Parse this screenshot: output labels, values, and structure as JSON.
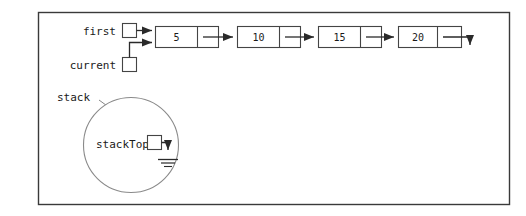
{
  "diagram": {
    "title_text": "",
    "background_color": "#ffffff",
    "outline_color": "#3a3a3a",
    "stroke_color": "#333333",
    "fill_color": "#ffffff",
    "frame": {
      "x": 38,
      "y": 12,
      "width": 472,
      "height": 193
    },
    "pointers": [
      {
        "name": "first",
        "label": "first",
        "box_x": 122,
        "box_y": 23,
        "box_size": 15,
        "label_x": 116,
        "label_y": 35
      },
      {
        "name": "current",
        "label": "current",
        "box_x": 122,
        "box_y": 57,
        "box_size": 15,
        "label_x": 116,
        "label_y": 69
      }
    ],
    "linked_list": {
      "node_width": 64,
      "node_height": 22,
      "data_cell_width": 42,
      "node_y": 26,
      "nodes": [
        {
          "value": "5",
          "x": 155
        },
        {
          "value": "10",
          "x": 237
        },
        {
          "value": "15",
          "x": 318
        },
        {
          "value": "20",
          "x": 398
        }
      ],
      "terminator": "down-arrow"
    },
    "stack": {
      "label": "stack",
      "label_x": 57,
      "label_y": 101,
      "circle_cx": 131,
      "circle_cy": 145,
      "circle_r": 48,
      "top_pointer": {
        "label": "stackTop",
        "label_x": 96,
        "label_y": 148,
        "box_x": 147,
        "box_y": 135,
        "box_size": 15,
        "null_symbol": "ground"
      }
    }
  }
}
